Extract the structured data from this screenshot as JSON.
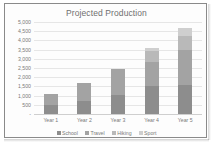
{
  "chart_data": {
    "type": "bar",
    "subtype": "stacked-column",
    "title": "Projected Production",
    "xlabel": "",
    "ylabel": "",
    "categories": [
      "Year 1",
      "Year 2",
      "Year 3",
      "Year 4",
      "Year 5"
    ],
    "series": [
      {
        "name": "School",
        "color": "#8d8d8d",
        "values": [
          500,
          700,
          1050,
          1500,
          1600
        ]
      },
      {
        "name": "Travel",
        "color": "#a3a3a3",
        "values": [
          600,
          1000,
          1400,
          1350,
          1900
        ]
      },
      {
        "name": "Hiking",
        "color": "#b9b9b9",
        "values": [
          0,
          0,
          0,
          550,
          750
        ]
      },
      {
        "name": "Sport",
        "color": "#cfcfcf",
        "values": [
          0,
          0,
          0,
          200,
          450
        ]
      }
    ],
    "totals": [
      1100,
      1700,
      2450,
      3600,
      4700
    ],
    "ylim": [
      0,
      5000
    ],
    "ytick_values": [
      0,
      500,
      1000,
      1500,
      2000,
      2500,
      3000,
      3500,
      4000,
      4500,
      5000
    ],
    "ytick_labels": [
      "-",
      "500",
      "1,000",
      "1,500",
      "2,000",
      "2,500",
      "3,000",
      "3,500",
      "4,000",
      "4,500",
      "5,000"
    ],
    "grid": true,
    "legend_position": "bottom"
  },
  "legend": {
    "items": [
      {
        "label": "School",
        "color": "#8d8d8d"
      },
      {
        "label": "Travel",
        "color": "#a3a3a3"
      },
      {
        "label": "Hiking",
        "color": "#b9b9b9"
      },
      {
        "label": "Sport",
        "color": "#cfcfcf"
      }
    ]
  }
}
